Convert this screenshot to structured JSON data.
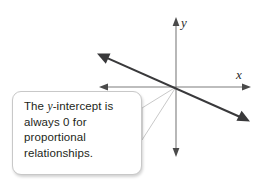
{
  "figure": {
    "type": "coordinate-plane-with-callout",
    "background_color": "#ffffff"
  },
  "graph": {
    "origin": {
      "x": 176,
      "y": 87
    },
    "axis_color": "#7d7d7d",
    "line_color": "#39393b",
    "x_axis": {
      "label": "x",
      "from": {
        "x": 100,
        "y": 87
      },
      "to": {
        "x": 250,
        "y": 87
      },
      "arrows": "both"
    },
    "y_axis": {
      "label": "y",
      "from": {
        "x": 176,
        "y": 18
      },
      "to": {
        "x": 176,
        "y": 157
      },
      "arrows": "both"
    },
    "plotted_line": {
      "description": "proportional line through the origin with negative slope",
      "from": {
        "x": 98,
        "y": 54
      },
      "to": {
        "x": 249,
        "y": 121
      },
      "slope": -0.44,
      "y_intercept": 0,
      "arrows": "both"
    }
  },
  "callout": {
    "text_lines": [
      "The y-intercept is",
      "always 0 for",
      "proportional",
      "relationships."
    ],
    "text_prefix": "The ",
    "text_italic": "y",
    "text_suffix": "-intercept is always 0 for proportional relationships.",
    "border_color": "#c8c8c8",
    "fill_color": "#ffffff",
    "text_color": "#231f20",
    "pointer_target": {
      "x": 176,
      "y": 87
    }
  }
}
